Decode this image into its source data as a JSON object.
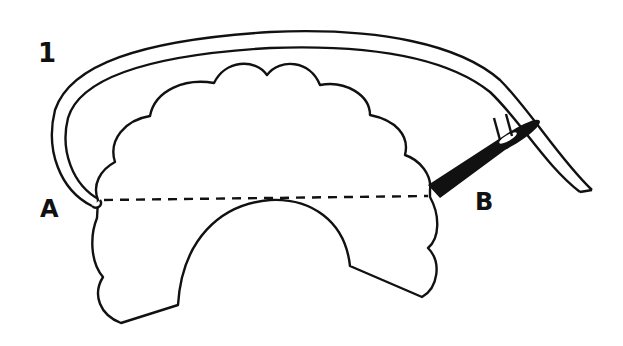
{
  "figure": {
    "step_number": "1",
    "point_a_label": "A",
    "point_b_label": "B",
    "colors": {
      "ink": "#111111",
      "background": "#ffffff"
    }
  }
}
